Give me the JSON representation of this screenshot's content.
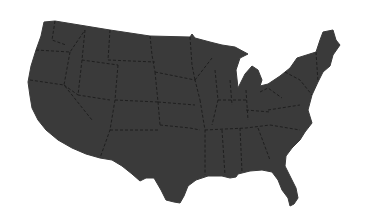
{
  "map": {
    "title": "United States",
    "subject": "contiguous-us-states-silhouette",
    "colors": {
      "background": "#ffffff",
      "land_fill": "#3a3a3a",
      "state_border": "#1c1c1c"
    },
    "outline": "M44,22 L55,21 L110,30 L150,36 L190,37 L192,34 L195,38 L210,42 L222,45 L235,47 L248,54 L240,58 L236,70 L238,88 L242,80 L245,74 L252,66 L258,70 L262,80 L260,86 L268,84 L280,76 L290,68 L297,58 L316,52 L320,40 L323,32 L333,30 L336,40 L340,45 L333,55 L330,66 L323,72 L318,82 L312,95 L308,110 L312,123 L305,132 L300,140 L292,148 L286,156 L285,166 L290,176 L296,188 L298,198 L294,204 L290,206 L288,198 L282,190 L278,180 L272,172 L262,170 L250,171 L238,174 L236,177 L230,178 L222,176 L208,176 L196,180 L188,186 L184,196 L180,203 L174,202 L166,200 L161,190 L154,178 L146,178 L140,181 L132,174 L122,166 L112,160 L100,158 L86,154 L72,148 L58,140 L46,130 L38,120 L32,108 L30,96 L28,82 L31,66 L36,50 L41,36 L44,22 Z",
    "state_borders": [
      "M55,21 L52,40 L66,45",
      "M36,50 L70,52 L85,30",
      "M70,52 L64,85 L92,120",
      "M30,80 L64,85",
      "M85,30 L82,60 L118,65",
      "M82,60 L78,95 L110,100",
      "M64,85 L78,95",
      "M110,30 L108,60",
      "M118,65 L115,100 L110,130 L100,158",
      "M150,36 L152,55 L155,72",
      "M108,60 L155,62",
      "M115,100 L158,102",
      "M155,72 L158,102 L160,125",
      "M110,130 L160,130",
      "M160,125 L190,128 L200,130",
      "M158,102 L195,105",
      "M190,37 L192,65 L195,80",
      "M155,72 L195,80 L200,100",
      "M200,100 L205,130 L205,175",
      "M195,80 L212,58",
      "M215,70 L218,100 L212,125",
      "M230,80 L232,105",
      "M246,90 L248,120",
      "M205,130 L246,128 L270,125",
      "M218,100 L246,100",
      "M222,130 L225,175",
      "M240,128 L242,172",
      "M258,128 L270,160",
      "M260,92 L268,88 L282,98",
      "M268,110 L300,105",
      "M270,125 L300,130",
      "M246,110 L270,112",
      "M285,72 L300,80 L312,95",
      "M316,52 L318,82"
    ]
  }
}
